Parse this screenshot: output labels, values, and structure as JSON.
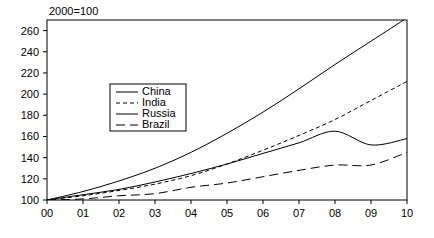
{
  "chart_data": {
    "type": "line",
    "title": "2000=100",
    "xlabel": "",
    "ylabel": "",
    "x": [
      "00",
      "01",
      "02",
      "03",
      "04",
      "05",
      "06",
      "07",
      "08",
      "09",
      "10"
    ],
    "xlim": [
      0,
      10
    ],
    "ylim": [
      100,
      270
    ],
    "yticks": [
      100,
      120,
      140,
      160,
      180,
      200,
      220,
      240,
      260
    ],
    "grid": false,
    "legend_position": "center-left",
    "series": [
      {
        "name": "China",
        "style": "solid",
        "values": [
          100,
          108,
          118,
          130,
          145,
          163,
          183,
          205,
          228,
          250,
          272
        ]
      },
      {
        "name": "India",
        "style": "dotted",
        "values": [
          100,
          104,
          109,
          115,
          123,
          134,
          147,
          161,
          176,
          194,
          212
        ]
      },
      {
        "name": "Russia",
        "style": "solid",
        "values": [
          100,
          105,
          110,
          117,
          125,
          134,
          144,
          154,
          165,
          152,
          158
        ]
      },
      {
        "name": "Brazil",
        "style": "dashed",
        "values": [
          100,
          101,
          104,
          106,
          112,
          116,
          122,
          128,
          133,
          133,
          145
        ]
      }
    ]
  },
  "legend": {
    "entries": [
      {
        "label": "China"
      },
      {
        "label": "India"
      },
      {
        "label": "Russia"
      },
      {
        "label": "Brazil"
      }
    ]
  },
  "colors": {
    "line": "#000000",
    "frame": "#000000",
    "background": "#ffffff"
  }
}
